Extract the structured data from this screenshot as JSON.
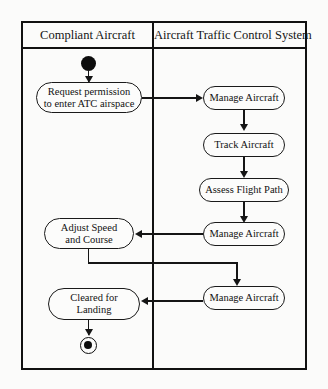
{
  "diagram": {
    "type": "uml-activity-diagram",
    "background_color": "#fbfbfa",
    "line_color": "#151515"
  },
  "swimlanes": [
    {
      "id": "compliant-aircraft",
      "label": "Compliant Aircraft"
    },
    {
      "id": "atc-system",
      "label": "Aircraft Traffic Control System"
    }
  ],
  "nodes": {
    "start": {
      "kind": "initial-node",
      "lane": "compliant-aircraft"
    },
    "request_permission": {
      "kind": "action",
      "lane": "compliant-aircraft",
      "line1": "Request permission",
      "line2": "to enter ATC airspace"
    },
    "manage_aircraft_1": {
      "kind": "action",
      "lane": "atc-system",
      "line1": "Manage Aircraft"
    },
    "track_aircraft": {
      "kind": "action",
      "lane": "atc-system",
      "line1": "Track Aircraft"
    },
    "assess_flight_path": {
      "kind": "action",
      "lane": "atc-system",
      "line1": "Assess Flight Path"
    },
    "manage_aircraft_2": {
      "kind": "action",
      "lane": "atc-system",
      "line1": "Manage Aircraft"
    },
    "adjust_speed": {
      "kind": "action",
      "lane": "compliant-aircraft",
      "line1": "Adjust Speed",
      "line2": "and Course"
    },
    "manage_aircraft_3": {
      "kind": "action",
      "lane": "atc-system",
      "line1": "Manage Aircraft"
    },
    "cleared_for_landing": {
      "kind": "action",
      "lane": "compliant-aircraft",
      "line1": "Cleared for",
      "line2": "Landing"
    },
    "end": {
      "kind": "final-node",
      "lane": "compliant-aircraft"
    }
  },
  "flows": [
    {
      "from": "start",
      "to": "request_permission"
    },
    {
      "from": "request_permission",
      "to": "manage_aircraft_1"
    },
    {
      "from": "manage_aircraft_1",
      "to": "track_aircraft"
    },
    {
      "from": "track_aircraft",
      "to": "assess_flight_path"
    },
    {
      "from": "assess_flight_path",
      "to": "manage_aircraft_2"
    },
    {
      "from": "manage_aircraft_2",
      "to": "adjust_speed"
    },
    {
      "from": "adjust_speed",
      "to": "manage_aircraft_3"
    },
    {
      "from": "manage_aircraft_3",
      "to": "cleared_for_landing"
    },
    {
      "from": "cleared_for_landing",
      "to": "end"
    }
  ]
}
